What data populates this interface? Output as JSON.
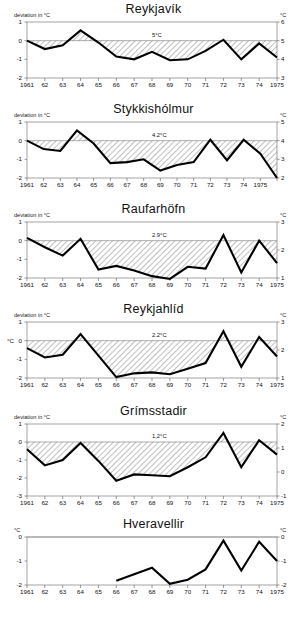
{
  "figure": {
    "axis_label_left": "deviation in °C",
    "axis_unit_right": "°C",
    "axis_unit_left": "°C"
  },
  "chart_data": [
    {
      "type": "line",
      "title": "Reykjavík",
      "xlabel": "",
      "ylabel": "deviation in °C",
      "ylabel_right": "°C",
      "mean_annotation": "5°C",
      "grid": false,
      "legend": "none",
      "hatched_between_curve_and_zero": true,
      "ylim": [
        -2,
        1
      ],
      "yticks": [
        1,
        0,
        -1,
        -2
      ],
      "ytick_labels": [
        "1",
        "0",
        "-1",
        "-2"
      ],
      "ylim_right": [
        3,
        6
      ],
      "yticks_right": [
        6,
        5,
        4,
        3
      ],
      "ytick_labels_right": [
        "6",
        "5",
        "4",
        "3"
      ],
      "xlim": [
        1961,
        1975
      ],
      "x": [
        1961,
        1962,
        1963,
        1964,
        1965,
        1966,
        1967,
        1968,
        1969,
        1970,
        1971,
        1972,
        1973,
        1974,
        1975
      ],
      "xtick_labels": [
        "1961",
        "62",
        "63",
        "64",
        "65",
        "66",
        "67",
        "68",
        "69",
        "70",
        "71",
        "72",
        "73",
        "74",
        "1975"
      ],
      "values": [
        0.0,
        -0.45,
        -0.25,
        0.55,
        -0.1,
        -0.85,
        -1.0,
        -0.6,
        -1.05,
        -1.0,
        -0.55,
        0.05,
        -1.0,
        -0.15,
        -0.9
      ]
    },
    {
      "type": "line",
      "title": "Stykkishólmur",
      "xlabel": "",
      "ylabel": "deviation in °C",
      "ylabel_right": "°C",
      "mean_annotation": "4.2°C",
      "grid": false,
      "legend": "none",
      "hatched_between_curve_and_zero": true,
      "ylim": [
        -2,
        1
      ],
      "yticks": [
        1,
        0,
        -1,
        -2
      ],
      "ytick_labels": [
        "1",
        "0",
        "-1",
        "-2"
      ],
      "ylim_right": [
        2,
        5
      ],
      "yticks_right": [
        5,
        4,
        3,
        2
      ],
      "ytick_labels_right": [
        "5",
        "4",
        "3",
        "2"
      ],
      "xlim": [
        1961,
        1976
      ],
      "x": [
        1961,
        1962,
        1963,
        1964,
        1965,
        1966,
        1967,
        1968,
        1969,
        1970,
        1971,
        1972,
        1973,
        1974,
        1975,
        1976
      ],
      "xtick_labels": [
        "1961",
        "62",
        "63",
        "64",
        "65",
        "66",
        "67",
        "68",
        "69",
        "70",
        "71",
        "72",
        "73",
        "74",
        "1975",
        ""
      ],
      "values": [
        0.0,
        -0.45,
        -0.55,
        0.55,
        -0.15,
        -1.2,
        -1.15,
        -1.0,
        -1.6,
        -1.3,
        -1.15,
        0.05,
        -1.05,
        0.05,
        -0.7,
        -2.0
      ]
    },
    {
      "type": "line",
      "title": "Raufarhöfn",
      "xlabel": "",
      "ylabel": "deviation in °C",
      "ylabel_right": "°C",
      "mean_annotation": "2.9°C",
      "grid": false,
      "legend": "none",
      "hatched_between_curve_and_zero": true,
      "ylim": [
        -2,
        1
      ],
      "yticks": [
        1,
        0,
        -1,
        -2
      ],
      "ytick_labels": [
        "1",
        "0",
        "-1",
        "-2"
      ],
      "ylim_right": [
        1,
        3
      ],
      "yticks_right": [
        3,
        2,
        1
      ],
      "ytick_labels_right": [
        "3",
        "2",
        "1"
      ],
      "xlim": [
        1961,
        1975
      ],
      "x": [
        1961,
        1962,
        1963,
        1964,
        1965,
        1966,
        1967,
        1968,
        1969,
        1970,
        1971,
        1972,
        1973,
        1974,
        1975
      ],
      "xtick_labels": [
        "1961",
        "62",
        "63",
        "64",
        "65",
        "66",
        "67",
        "68",
        "69",
        "70",
        "71",
        "72",
        "73",
        "74",
        "1975"
      ],
      "values": [
        0.15,
        -0.35,
        -0.8,
        0.1,
        -1.55,
        -1.35,
        -1.6,
        -1.9,
        -2.05,
        -1.4,
        -1.5,
        0.3,
        -1.7,
        0.0,
        -1.2
      ]
    },
    {
      "type": "line",
      "title": "Reykjahlíd",
      "xlabel": "",
      "ylabel": "deviation in °C",
      "ylabel_right": "°C",
      "ylabel_left_unit": "°C",
      "mean_annotation": "2.2°C",
      "grid": false,
      "legend": "none",
      "hatched_between_curve_and_zero": true,
      "ylim": [
        -2,
        1
      ],
      "yticks": [
        1,
        0,
        -1,
        -2
      ],
      "ytick_labels": [
        "1",
        "0",
        "-1",
        "-2"
      ],
      "ylim_right": [
        1,
        3
      ],
      "yticks_right": [
        3,
        2,
        1
      ],
      "ytick_labels_right": [
        "3",
        "2",
        "1"
      ],
      "xlim": [
        1961,
        1975
      ],
      "x": [
        1961,
        1962,
        1963,
        1964,
        1965,
        1966,
        1967,
        1968,
        1969,
        1970,
        1971,
        1972,
        1973,
        1974,
        1975
      ],
      "xtick_labels": [
        "1961",
        "62",
        "63",
        "64",
        "65",
        "66",
        "67",
        "68",
        "69",
        "70",
        "71",
        "72",
        "73",
        "74",
        "1975"
      ],
      "values": [
        -0.4,
        -0.9,
        -0.75,
        0.35,
        -0.8,
        -1.95,
        -1.75,
        -1.7,
        -1.8,
        -1.5,
        -1.2,
        0.5,
        -1.4,
        0.2,
        -0.85
      ]
    },
    {
      "type": "line",
      "title": "Grímsstadir",
      "xlabel": "",
      "ylabel": "deviation in °C",
      "ylabel_right": "°C",
      "mean_annotation": "1,2°C",
      "grid": false,
      "legend": "none",
      "hatched_between_curve_and_zero": true,
      "ylim": [
        -3,
        1
      ],
      "yticks": [
        1,
        0,
        -1,
        -2,
        -3
      ],
      "ytick_labels": [
        "1",
        "0",
        "-1",
        "-2",
        "-3"
      ],
      "ylim_right": [
        -1,
        2
      ],
      "yticks_right": [
        2,
        1,
        0,
        -1
      ],
      "ytick_labels_right": [
        "2",
        "1",
        "0",
        "-1"
      ],
      "xlim": [
        1961,
        1975
      ],
      "x": [
        1961,
        1962,
        1963,
        1964,
        1965,
        1966,
        1967,
        1968,
        1969,
        1970,
        1971,
        1972,
        1973,
        1974,
        1975
      ],
      "xtick_labels": [
        "1961",
        "62",
        "63",
        "64",
        "65",
        "66",
        "67",
        "68",
        "69",
        "70",
        "71",
        "72",
        "73",
        "74",
        "1975"
      ],
      "values": [
        -0.4,
        -1.3,
        -1.0,
        -0.05,
        -1.05,
        -2.15,
        -1.8,
        -1.85,
        -1.9,
        -1.4,
        -0.85,
        0.5,
        -1.4,
        0.1,
        -0.7
      ]
    },
    {
      "type": "line",
      "title": "Hveravellir",
      "xlabel": "",
      "ylabel": "°C",
      "ylabel_right": "°C",
      "mean_annotation": "",
      "grid": false,
      "legend": "none",
      "hatched_between_curve_and_zero": false,
      "ylim": [
        -2,
        0
      ],
      "yticks": [
        0,
        -1,
        -2
      ],
      "ytick_labels": [
        "0",
        "-1",
        "-2"
      ],
      "ylim_right": [
        -2,
        0
      ],
      "yticks_right": [
        0,
        -1,
        -2
      ],
      "ytick_labels_right": [
        "0",
        "-1",
        "-2"
      ],
      "xlim": [
        1961,
        1975
      ],
      "x": [
        1966,
        1967,
        1968,
        1969,
        1970,
        1971,
        1972,
        1973,
        1974,
        1975
      ],
      "xtick_labels": [
        "1961",
        "62",
        "63",
        "64",
        "65",
        "66",
        "67",
        "68",
        "69",
        "70",
        "71",
        "72",
        "73",
        "74",
        "1975"
      ],
      "values": [
        -1.82,
        -1.55,
        -1.28,
        -1.95,
        -1.78,
        -1.35,
        -0.15,
        -1.4,
        -0.2,
        -1.0
      ]
    }
  ]
}
